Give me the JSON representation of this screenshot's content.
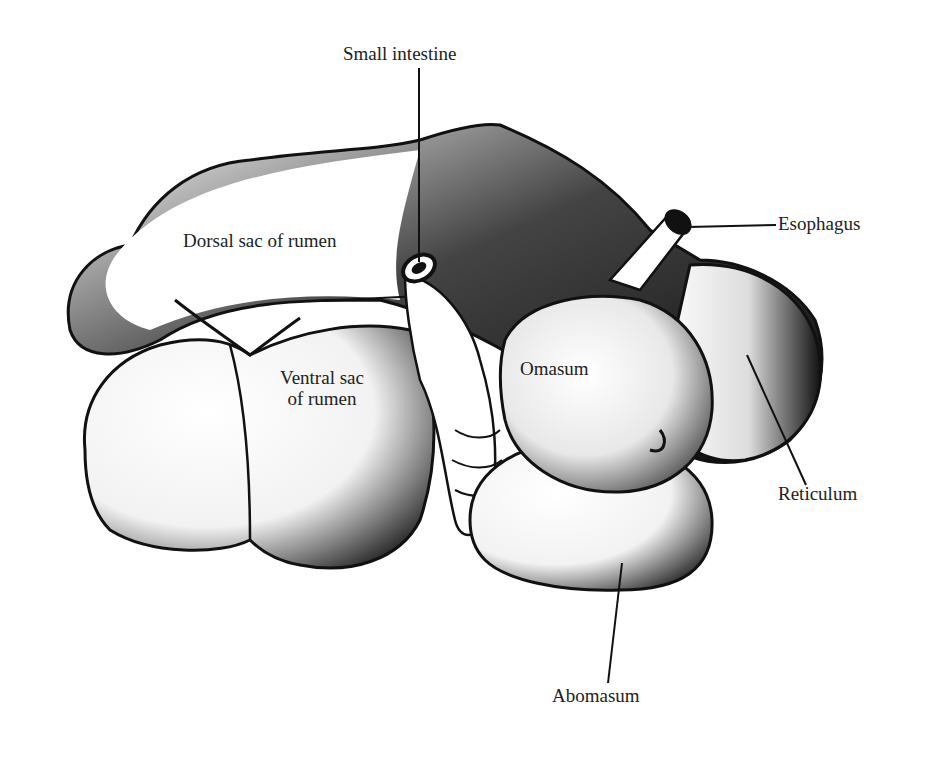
{
  "figure": {
    "type": "anatomical illustration",
    "colors": {
      "ink": "#111111",
      "paper": "#ffffff",
      "label": "#222222"
    }
  },
  "labels": {
    "small_intestine": "Small intestine",
    "esophagus": "Esophagus",
    "dorsal_sac": "Dorsal sac of rumen",
    "ventral_sac_line1": "Ventral sac",
    "ventral_sac_line2": "of rumen",
    "omasum": "Omasum",
    "reticulum": "Reticulum",
    "abomasum": "Abomasum"
  }
}
